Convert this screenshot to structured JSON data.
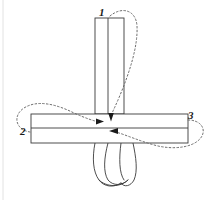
{
  "figure": {
    "kind": "line-diagram",
    "background_color": "#ffffff",
    "stroke_color": "#3a3a3a",
    "arrow_color": "#1a1a1a",
    "dash_color": "#6b6b6b",
    "fill_color": "#ffffff"
  },
  "labels": [
    {
      "id": "label-1",
      "text": "1",
      "x": 99,
      "y": 7
    },
    {
      "id": "label-2",
      "text": "2",
      "x": 20,
      "y": 126
    },
    {
      "id": "label-3",
      "text": "3",
      "x": 188,
      "y": 110
    }
  ],
  "geometry": {
    "vertical_strip": {
      "left_x": 95,
      "right_x": 124,
      "fold_line_x": 108,
      "top_y": 18,
      "band_top_y": 114
    },
    "horizontal_strip": {
      "left_x": 31,
      "right_x": 188,
      "top_y": 114,
      "mid_y": 128,
      "bottom_y": 143
    },
    "hanging_loop": {
      "top_y": 143,
      "bottom_y": 186,
      "left_x": 93,
      "right_x": 138
    },
    "left_margin_rule_x": 3
  },
  "arrows": [
    {
      "id": "arrow-right-center",
      "direction": "right",
      "x": 101,
      "y": 121
    },
    {
      "id": "arrow-down-center",
      "direction": "down",
      "x": 111,
      "y": 118
    },
    {
      "id": "arrow-left-lower",
      "direction": "left",
      "x": 113,
      "y": 131
    }
  ],
  "dashed_paths": [
    {
      "id": "path-from-1",
      "from_label": "1",
      "to_arrow": "arrow-down-center"
    },
    {
      "id": "path-from-2",
      "from_label": "2",
      "to_arrow": "arrow-right-center"
    },
    {
      "id": "path-from-3",
      "from_label": "3",
      "to_arrow": "arrow-left-lower"
    }
  ]
}
